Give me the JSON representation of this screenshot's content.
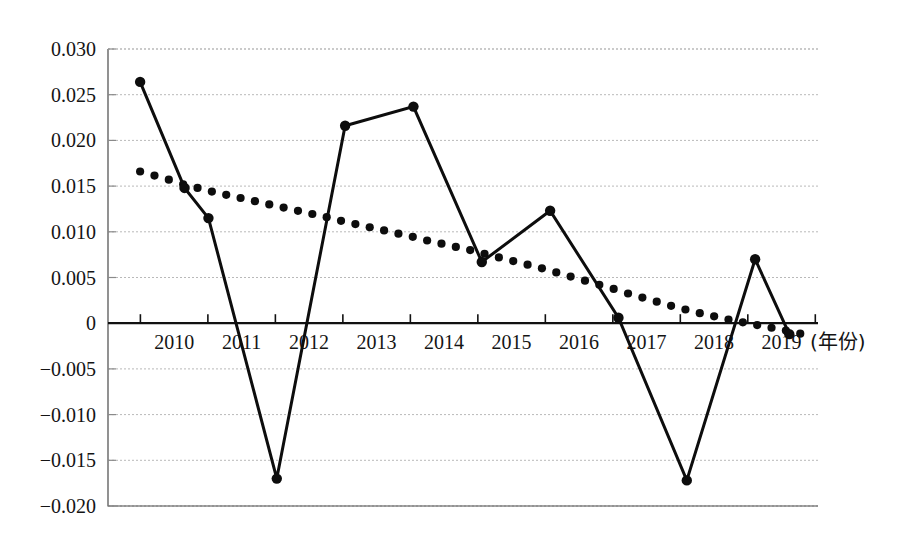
{
  "chart_data": {
    "type": "line",
    "title": "",
    "subtitle": "",
    "xlabel": "(年份)",
    "ylabel": "",
    "xlim": [
      2009.5,
      2019.9
    ],
    "ylim": [
      -0.02,
      0.03
    ],
    "grid": true,
    "legend_position": "none",
    "categories": [
      "2010",
      "2011",
      "2012",
      "2013",
      "2014",
      "2015",
      "2016",
      "2017",
      "2018",
      "2019"
    ],
    "y_ticks": [
      0.03,
      0.025,
      0.02,
      0.015,
      0.01,
      0.005,
      0,
      -0.005,
      -0.01,
      -0.015,
      -0.02
    ],
    "y_tick_labels": [
      "0.030",
      "0.025",
      "0.020",
      "0.015",
      "0.010",
      "0.005",
      "0",
      "−0.005",
      "−0.010",
      "−0.015",
      "−0.020"
    ],
    "x_tick_labels": [
      "2010",
      "2011",
      "2012",
      "2013",
      "2014",
      "2015",
      "2016",
      "2017",
      "2018",
      "2019"
    ],
    "series": [
      {
        "name": "solid-line-series",
        "style": "solid-with-round-markers",
        "color": "#0d0d0d",
        "x": [
          2010.0,
          2010.65,
          2011.0,
          2012.0,
          2013.0,
          2014.0,
          2015.0,
          2016.0,
          2017.0,
          2018.0,
          2019.0,
          2019.5
        ],
        "values": [
          0.0264,
          0.0148,
          0.0115,
          -0.017,
          0.0216,
          0.0237,
          0.0067,
          0.0123,
          0.0006,
          -0.0172,
          0.007,
          -0.0012
        ]
      },
      {
        "name": "dotted-trend-series",
        "style": "dotted-round-markers-only",
        "color": "#0d0d0d",
        "x": [
          2010.0,
          2010.21,
          2010.42,
          2010.63,
          2010.84,
          2011.05,
          2011.26,
          2011.47,
          2011.68,
          2011.89,
          2012.1,
          2012.31,
          2012.52,
          2012.73,
          2012.94,
          2013.15,
          2013.36,
          2013.57,
          2013.78,
          2013.99,
          2014.2,
          2014.41,
          2014.62,
          2014.83,
          2015.04,
          2015.25,
          2015.46,
          2015.67,
          2015.88,
          2016.09,
          2016.3,
          2016.51,
          2016.72,
          2016.93,
          2017.14,
          2017.35,
          2017.56,
          2017.77,
          2017.98,
          2018.19,
          2018.4,
          2018.61,
          2018.82,
          2019.03,
          2019.24,
          2019.45,
          2019.66
        ],
        "values": [
          0.0166,
          0.01615,
          0.0157,
          0.0152,
          0.0148,
          0.0144,
          0.01405,
          0.0137,
          0.01335,
          0.013,
          0.01265,
          0.0123,
          0.01195,
          0.0116,
          0.0112,
          0.01085,
          0.0105,
          0.01015,
          0.0098,
          0.00945,
          0.00905,
          0.0087,
          0.00835,
          0.008,
          0.0076,
          0.0072,
          0.0068,
          0.0064,
          0.006,
          0.00555,
          0.0051,
          0.00465,
          0.0042,
          0.00375,
          0.00325,
          0.0028,
          0.00235,
          0.0019,
          0.0015,
          0.0011,
          0.00075,
          0.0004,
          0.0001,
          -0.0002,
          -0.0005,
          -0.0008,
          -0.00115
        ]
      }
    ]
  },
  "axis": {
    "x_caption": "(年份)"
  }
}
